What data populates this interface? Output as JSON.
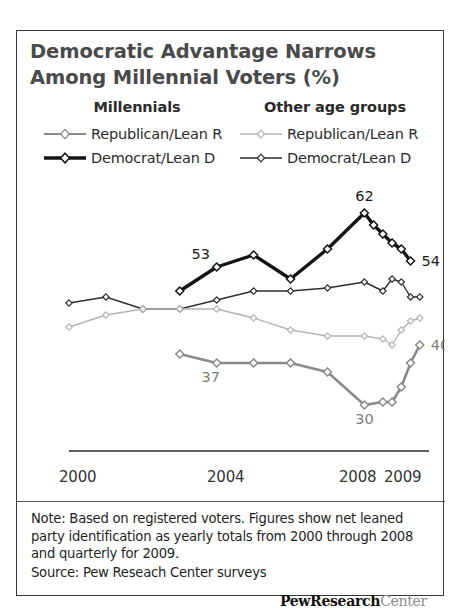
{
  "title": "Democratic Advantage Narrows Among Millennial Voters (%)",
  "legend": {
    "groups": [
      {
        "heading": "Millennials",
        "entries": [
          {
            "label": "Republican/Lean R",
            "color": "#8a8a8a",
            "width": 2.0,
            "marker": "diamond-open"
          },
          {
            "label": "Democrat/Lean D",
            "color": "#141414",
            "width": 3.4,
            "marker": "diamond-open"
          }
        ]
      },
      {
        "heading": "Other age groups",
        "entries": [
          {
            "label": "Republican/Lean R",
            "color": "#b3b3b3",
            "width": 1.3,
            "marker": "diamond-open"
          },
          {
            "label": "Democrat/Lean D",
            "color": "#2e2e2e",
            "width": 1.3,
            "marker": "diamond-open"
          }
        ]
      }
    ]
  },
  "axis": {
    "ticks": [
      {
        "label": "2000",
        "x": 42
      },
      {
        "label": "2004",
        "x": 190
      },
      {
        "label": "2008",
        "x": 322
      },
      {
        "label": "2009",
        "x": 367
      }
    ],
    "baseline_color": "#2b2b2b"
  },
  "footer": {
    "note": "Note: Based on registered voters. Figures show net leaned party identification as yearly totals from 2000 through 2008 and quarterly for 2009.",
    "source": "Source: Pew Reseach Center surveys",
    "logo_bold": "PewResearch",
    "logo_light": "Center"
  },
  "chart_data": {
    "type": "line",
    "title": "Democratic Advantage Narrows Among Millennial Voters (%)",
    "xlabel": "",
    "ylabel": "",
    "grid": false,
    "legend_position": "top",
    "x": [
      "2000",
      "2001",
      "2002",
      "2003",
      "2004",
      "2005",
      "2006",
      "2007",
      "2008",
      "2009 Q1",
      "2009 Q2",
      "2009 Q3",
      "2009 Q4"
    ],
    "xlim": [
      2000,
      2009.75
    ],
    "ylim": [
      26,
      66
    ],
    "series": [
      {
        "name": "Millennials Democrat/Lean D",
        "group": "Millennials",
        "party": "Democrat/Lean D",
        "color": "#141414",
        "width": 3.4,
        "x": [
          2003,
          2004,
          2005,
          2006,
          2007,
          2008,
          2008.25,
          2008.5,
          2008.75,
          2009,
          2009.25,
          2009.5,
          2009.75
        ],
        "values": [
          49,
          53,
          55,
          51,
          56,
          62,
          60,
          58.5,
          57,
          56,
          54,
          null,
          null
        ],
        "labels": [
          {
            "x": 2004,
            "value": 53,
            "text": "53"
          },
          {
            "x": 2008,
            "value": 62,
            "text": "62"
          },
          {
            "x": 2009.25,
            "value": 54,
            "text": "54"
          }
        ]
      },
      {
        "name": "Millennials Republican/Lean R",
        "group": "Millennials",
        "party": "Republican/Lean R",
        "color": "#8a8a8a",
        "width": 2.6,
        "x": [
          2003,
          2004,
          2005,
          2006,
          2007,
          2008,
          2008.5,
          2008.75,
          2009,
          2009.25,
          2009.5,
          2009.75
        ],
        "values": [
          38.5,
          37,
          37,
          37,
          35.5,
          30,
          30.5,
          30.5,
          33,
          37,
          40,
          null
        ],
        "labels": [
          {
            "x": 2004,
            "value": 37,
            "text": "37"
          },
          {
            "x": 2008,
            "value": 30,
            "text": "30"
          },
          {
            "x": 2009.5,
            "value": 40,
            "text": "40"
          }
        ]
      },
      {
        "name": "Other age groups Democrat/Lean D",
        "group": "Other age groups",
        "party": "Democrat/Lean D",
        "color": "#2e2e2e",
        "width": 1.4,
        "x": [
          2000,
          2001,
          2002,
          2003,
          2004,
          2005,
          2006,
          2007,
          2008,
          2008.5,
          2008.75,
          2009,
          2009.25,
          2009.5
        ],
        "values": [
          47,
          48,
          46,
          46,
          47.5,
          49,
          49,
          49.5,
          50.5,
          49,
          51,
          50.5,
          48,
          48
        ],
        "labels": []
      },
      {
        "name": "Other age groups Republican/Lean R",
        "group": "Other age groups",
        "party": "Republican/Lean R",
        "color": "#b3b3b3",
        "width": 1.4,
        "x": [
          2000,
          2001,
          2002,
          2003,
          2004,
          2005,
          2006,
          2007,
          2008,
          2008.5,
          2008.75,
          2009,
          2009.25,
          2009.5
        ],
        "values": [
          43,
          45,
          46,
          46,
          46,
          44.5,
          42.5,
          41.5,
          41.5,
          41,
          40,
          42.5,
          44,
          44.5
        ],
        "labels": []
      }
    ]
  }
}
